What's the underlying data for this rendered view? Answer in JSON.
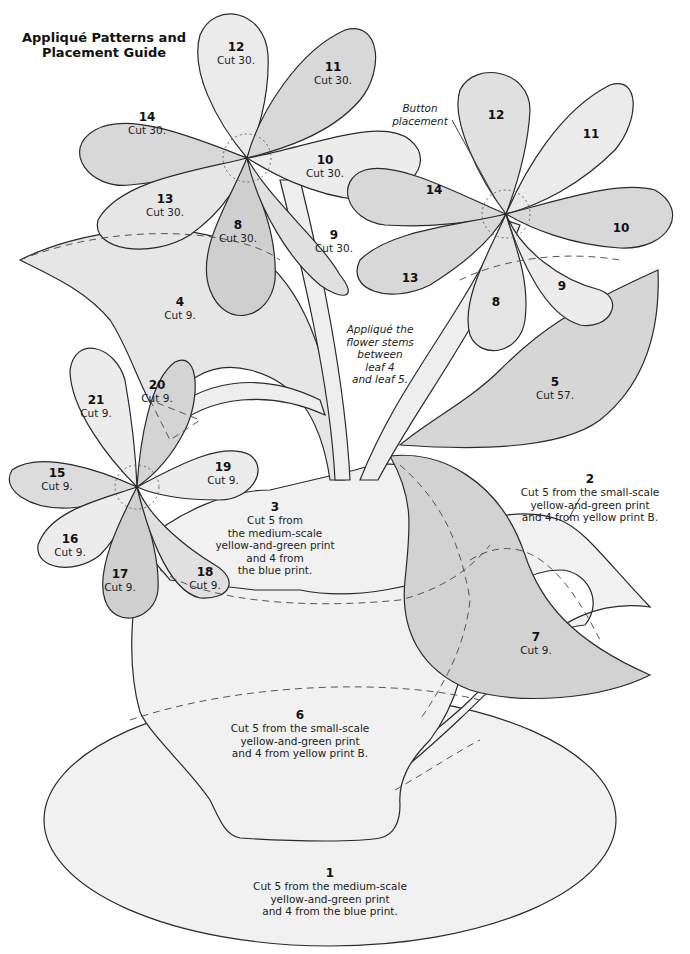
{
  "title": {
    "line1": "Appliqué Patterns and",
    "line2": "Placement Guide"
  },
  "colors": {
    "light": "#f1f1f1",
    "mid": "#e0e0e0",
    "dark": "#cfcfcf",
    "outline": "#2a2a2a",
    "dashed": "#555555"
  },
  "notes": {
    "button": {
      "line1": "Button",
      "line2": "placement"
    },
    "stems": {
      "line1": "Appliqué the",
      "line2": "flower stems",
      "line3": "between",
      "line4": "leaf 4",
      "line5": "and leaf 5."
    }
  },
  "pieces": {
    "p1": {
      "num": "1",
      "l1": "Cut 5 from the medium-scale",
      "l2": "yellow-and-green print",
      "l3": "and 4 from the blue print."
    },
    "p2": {
      "num": "2",
      "l1": "Cut 5 from the small-scale",
      "l2": "yellow-and-green print",
      "l3": "and 4 from yellow print B."
    },
    "p3": {
      "num": "3",
      "l1": "Cut 5 from",
      "l2": "the medium-scale",
      "l3": "yellow-and-green print",
      "l4": "and 4 from",
      "l5": "the blue print."
    },
    "p4": {
      "num": "4",
      "cut": "Cut 9."
    },
    "p5": {
      "num": "5",
      "cut": "Cut 57."
    },
    "p6": {
      "num": "6",
      "l1": "Cut 5 from the small-scale",
      "l2": "yellow-and-green print",
      "l3": "and 4 from yellow print B."
    },
    "p7": {
      "num": "7",
      "cut": "Cut 9."
    },
    "f1": {
      "p8": {
        "num": "8",
        "cut": "Cut 30."
      },
      "p9": {
        "num": "9",
        "cut": "Cut 30."
      },
      "p10": {
        "num": "10",
        "cut": "Cut 30."
      },
      "p11": {
        "num": "11",
        "cut": "Cut 30."
      },
      "p12": {
        "num": "12",
        "cut": "Cut 30."
      },
      "p13": {
        "num": "13",
        "cut": "Cut 30."
      },
      "p14": {
        "num": "14",
        "cut": "Cut 30."
      }
    },
    "f2": {
      "p8": "8",
      "p9": "9",
      "p10": "10",
      "p11": "11",
      "p12": "12",
      "p13": "13",
      "p14": "14"
    },
    "f3": {
      "p15": {
        "num": "15",
        "cut": "Cut 9."
      },
      "p16": {
        "num": "16",
        "cut": "Cut 9."
      },
      "p17": {
        "num": "17",
        "cut": "Cut 9."
      },
      "p18": {
        "num": "18",
        "cut": "Cut 9."
      },
      "p19": {
        "num": "19",
        "cut": "Cut 9."
      },
      "p20": {
        "num": "20",
        "cut": "Cut 9."
      },
      "p21": {
        "num": "21",
        "cut": "Cut 9."
      }
    }
  }
}
